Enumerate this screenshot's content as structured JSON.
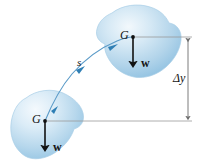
{
  "figure": {
    "domain": "Diagram",
    "kind": "physics-free-body-displacement-diagram",
    "background_color": "#ffffff"
  },
  "labels": {
    "g_upper": "G",
    "g_lower": "G",
    "w_upper": "w",
    "w_lower": "w",
    "path": "s",
    "delta_y": "Δy"
  },
  "colors": {
    "body_fill_light": "#eaf3fa",
    "body_fill_mid": "#b7d7ec",
    "body_fill_deep": "#8ec0e0",
    "body_outline": "#a9cfe6",
    "path_curve": "#5b9bc8",
    "path_arrow": "#2f7fb5",
    "vector_arrow": "#111111",
    "dimension_line": "#8a8a8a",
    "reference_line": "#9a9a9a",
    "text": "#141414"
  },
  "elements": {
    "upper_body": {
      "name": "rigid-body-upper",
      "center_of_gravity": {
        "x": 133,
        "y": 37
      },
      "weight_vector": {
        "from_y": 37,
        "to_y": 70,
        "direction": "down"
      }
    },
    "lower_body": {
      "name": "rigid-body-lower",
      "center_of_gravity": {
        "x": 45,
        "y": 121
      },
      "weight_vector": {
        "from_y": 121,
        "to_y": 154,
        "direction": "down"
      }
    },
    "path": {
      "name": "displacement-path",
      "from": {
        "x": 45,
        "y": 121
      },
      "to": {
        "x": 133,
        "y": 37
      },
      "arrow_count": 3
    },
    "dimension": {
      "name": "delta-y-dimension",
      "x": 188,
      "top_y": 37,
      "bottom_y": 121,
      "reference_top_y": 37,
      "reference_bottom_y": 121
    }
  }
}
